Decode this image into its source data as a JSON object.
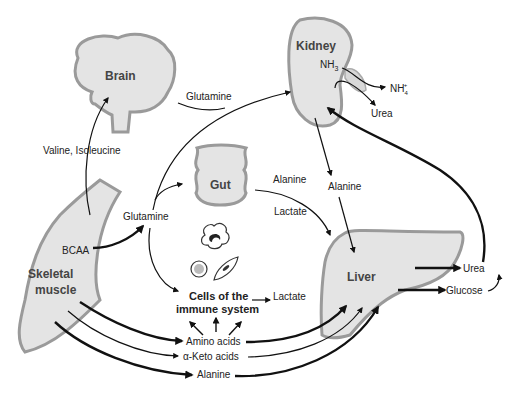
{
  "organs": {
    "brain": "Brain",
    "kidney": "Kidney",
    "gut": "Gut",
    "skeletal_muscle_line1": "Skeletal",
    "skeletal_muscle_line2": "muscle",
    "liver": "Liver",
    "immune_line1": "Cells of the",
    "immune_line2": "immune system"
  },
  "labels": {
    "valine_isoleucine": "Valine, Isoleucine",
    "glutamine_top": "Glutamine",
    "glutamine_mid": "Glutamine",
    "bcaa": "BCAA",
    "nh3": "NH",
    "nh3_sub": "3",
    "nh4": "NH",
    "nh4_sub": "4",
    "nh4_sup": "+",
    "urea_kidney": "Urea",
    "alanine_gut": "Alanine",
    "lactate_gut": "Lactate",
    "alanine_kidney": "Alanine",
    "lactate_immune": "Lactate",
    "urea_liver": "Urea",
    "glucose": "Glucose",
    "amino_acids": "Amino acids",
    "keto_acids": "α-Keto acids",
    "alanine_bottom": "Alanine"
  }
}
